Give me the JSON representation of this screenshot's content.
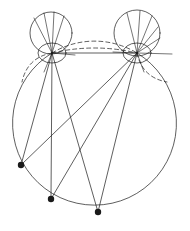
{
  "figure": {
    "type": "line-diagram",
    "canvas": {
      "width": 190,
      "height": 231,
      "background": "#ffffff"
    },
    "stroke": {
      "color": "#1a1a1a",
      "width": 0.7,
      "dash_pattern": "4,3"
    }
  },
  "chart_data": {
    "type": "scatter",
    "xlabel": "",
    "ylabel": "",
    "xlim": [
      0,
      190
    ],
    "ylim": [
      0,
      231
    ],
    "grid": false,
    "legend": "none",
    "shapes": [
      {
        "name": "main-circle",
        "kind": "circle",
        "cx": 95,
        "cy": 132,
        "r": 82,
        "style": "solid-lower-dashed-upper",
        "note": "Large primary circle; upper arc between the two nodal points is drawn dashed (hidden edge)."
      },
      {
        "name": "upper-left-circle",
        "kind": "circle",
        "cx": 51,
        "cy": 33,
        "r": 21,
        "style": "solid"
      },
      {
        "name": "upper-right-circle",
        "kind": "circle",
        "cx": 137,
        "cy": 33,
        "r": 23,
        "style": "solid"
      },
      {
        "name": "left-nodal-ellipse",
        "kind": "ellipse",
        "cx": 52,
        "cy": 53,
        "rx": 14,
        "ry": 10,
        "style": "solid"
      },
      {
        "name": "right-nodal-ellipse",
        "kind": "ellipse",
        "cx": 137,
        "cy": 53,
        "rx": 14,
        "ry": 10,
        "style": "solid"
      },
      {
        "name": "top-dashed-arc",
        "kind": "arc",
        "from": [
          52,
          53
        ],
        "to": [
          137,
          53
        ],
        "sagitta": -10,
        "style": "dashed",
        "note": "Dashed arc arcing upward between the two nodal points."
      },
      {
        "name": "lower-left-dashed-arc",
        "kind": "arc",
        "from": [
          52,
          53
        ],
        "to": [
          22,
          82
        ],
        "style": "dashed"
      },
      {
        "name": "lower-right-dashed-arc",
        "kind": "arc",
        "from": [
          137,
          53
        ],
        "to": [
          167,
          82
        ],
        "style": "dashed"
      }
    ],
    "nodes": [
      {
        "name": "left-nodal-point",
        "x": 52,
        "y": 53,
        "marker": "none"
      },
      {
        "name": "right-nodal-point",
        "x": 137,
        "y": 53,
        "marker": "none"
      },
      {
        "name": "lower-left-vertex",
        "x": 21,
        "y": 165,
        "marker": "filled-dot",
        "size": 3.2
      },
      {
        "name": "lower-mid-vertex",
        "x": 51,
        "y": 199,
        "marker": "filled-dot",
        "size": 3.2
      },
      {
        "name": "lower-right-vertex",
        "x": 98,
        "y": 212,
        "marker": "filled-dot",
        "size": 3.2
      }
    ],
    "edges": [
      {
        "name": "chord-node-to-node",
        "from": [
          52,
          53
        ],
        "to": [
          137,
          53
        ],
        "style": "solid"
      },
      {
        "name": "left-node-to-lower-left",
        "from": [
          52,
          53
        ],
        "to": [
          21,
          165
        ],
        "style": "solid"
      },
      {
        "name": "left-node-to-lower-mid",
        "from": [
          52,
          53
        ],
        "to": [
          51,
          199
        ],
        "style": "solid"
      },
      {
        "name": "left-node-to-lower-right",
        "from": [
          52,
          53
        ],
        "to": [
          98,
          212
        ],
        "style": "solid"
      },
      {
        "name": "right-node-to-lower-left",
        "from": [
          137,
          53
        ],
        "to": [
          21,
          165
        ],
        "style": "solid"
      },
      {
        "name": "right-node-to-lower-mid",
        "from": [
          137,
          53
        ],
        "to": [
          51,
          199
        ],
        "style": "solid"
      },
      {
        "name": "right-node-to-lower-right",
        "from": [
          137,
          53
        ],
        "to": [
          98,
          212
        ],
        "style": "solid"
      }
    ],
    "fan_lines": [
      {
        "name": "left-fan-1",
        "from": [
          52,
          53
        ],
        "to": [
          34,
          18
        ],
        "style": "solid"
      },
      {
        "name": "left-fan-2",
        "from": [
          52,
          53
        ],
        "to": [
          44,
          13
        ],
        "style": "solid"
      },
      {
        "name": "left-fan-3",
        "from": [
          52,
          53
        ],
        "to": [
          54,
          12
        ],
        "style": "solid"
      },
      {
        "name": "left-fan-4",
        "from": [
          52,
          53
        ],
        "to": [
          64,
          16
        ],
        "style": "solid"
      },
      {
        "name": "right-fan-1",
        "from": [
          137,
          53
        ],
        "to": [
          127,
          13
        ],
        "style": "solid"
      },
      {
        "name": "right-fan-2",
        "from": [
          137,
          53
        ],
        "to": [
          140,
          11
        ],
        "style": "solid"
      },
      {
        "name": "right-fan-3",
        "from": [
          137,
          53
        ],
        "to": [
          152,
          16
        ],
        "style": "solid"
      },
      {
        "name": "right-fan-4",
        "from": [
          137,
          53
        ],
        "to": [
          158,
          27
        ],
        "style": "solid"
      },
      {
        "name": "right-fan-5",
        "from": [
          137,
          53
        ],
        "to": [
          160,
          38
        ],
        "style": "solid"
      },
      {
        "name": "left-stub-right",
        "from": [
          52,
          53
        ],
        "to": [
          75,
          55
        ],
        "style": "solid"
      },
      {
        "name": "right-stub-left",
        "from": [
          137,
          53
        ],
        "to": [
          113,
          52
        ],
        "style": "solid"
      },
      {
        "name": "right-stub-right",
        "from": [
          137,
          53
        ],
        "to": [
          172,
          54
        ],
        "style": "solid"
      },
      {
        "name": "left-drop-1",
        "from": [
          52,
          53
        ],
        "to": [
          44,
          72
        ],
        "style": "solid"
      },
      {
        "name": "right-drop-1",
        "from": [
          137,
          53
        ],
        "to": [
          144,
          72
        ],
        "style": "solid"
      }
    ]
  }
}
